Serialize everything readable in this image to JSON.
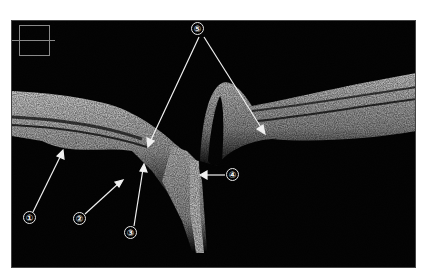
{
  "figure": {
    "type": "OCT B-scan of optic nerve head",
    "background": "#ffffff",
    "scan_background": "#050505",
    "tissue_color": "#c8c8c8",
    "arrow_color": "#f0f0f0"
  },
  "annotations": [
    {
      "id": 1,
      "symbol": "①",
      "x": 29,
      "y": 218
    },
    {
      "id": 2,
      "symbol": "②",
      "x": 79,
      "y": 219
    },
    {
      "id": 3,
      "symbol": "③",
      "x": 130,
      "y": 233
    },
    {
      "id": 4,
      "symbol": "④",
      "x": 232,
      "y": 175
    },
    {
      "id": 5,
      "symbol": "⑤",
      "x": 198,
      "y": 29
    }
  ],
  "inset": {
    "label": "scan-position-indicator"
  }
}
